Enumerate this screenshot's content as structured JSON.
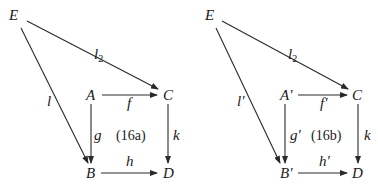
{
  "diagrams": [
    {
      "id": "16a",
      "nodes": {
        "E": "E",
        "A": "A",
        "C": "C",
        "B": "B",
        "D": "D"
      },
      "arrows": {
        "l2": "l",
        "l2_sub": "2",
        "l": "l",
        "f": "f",
        "g": "g",
        "k": "k",
        "h": "h"
      },
      "label": "(16a)"
    },
    {
      "id": "16b",
      "nodes": {
        "E": "E",
        "A": "A′",
        "C": "C",
        "B": "B′",
        "D": "D"
      },
      "arrows": {
        "l2": "l",
        "l2_sub": "2",
        "l": "l′",
        "f": "f′",
        "g": "g′",
        "k": "k",
        "h": "h′"
      },
      "label": "(16b)"
    }
  ]
}
